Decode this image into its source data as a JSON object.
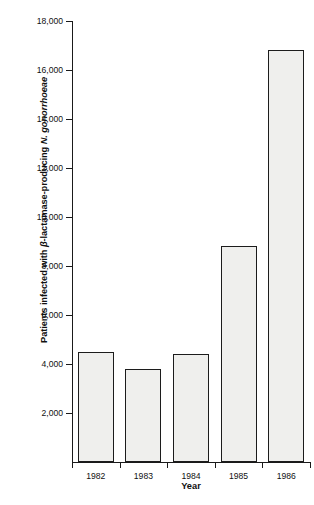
{
  "chart_data": {
    "type": "bar",
    "title": "",
    "xlabel": "Year",
    "ylabel_plain": "Patients infected with β-lactamase-producing N. gonorrhoeae",
    "ylabel_parts": {
      "before": "Patients infected with ",
      "beta": "β",
      "middle": "-lactamase-producing ",
      "italic_species": "N. gonorrhoeae"
    },
    "categories": [
      "1982",
      "1983",
      "1984",
      "1985",
      "1986"
    ],
    "values": [
      4500,
      3800,
      4400,
      8800,
      16800
    ],
    "ylim": [
      0,
      18000
    ],
    "ytick_values": [
      2000,
      4000,
      6000,
      8000,
      10000,
      12000,
      14000,
      16000,
      18000
    ],
    "ytick_labels": [
      "2,000",
      "4,000",
      "6,000",
      "8,000",
      "10,000",
      "12,000",
      "14,000",
      "16,000",
      "18,000"
    ],
    "grid": false,
    "legend": false,
    "colors": {
      "bar_fill": "#efefed",
      "bar_edge": "#1c1c1c",
      "axis": "#1a1a1a",
      "text": "#111111",
      "background": "#ffffff"
    }
  }
}
